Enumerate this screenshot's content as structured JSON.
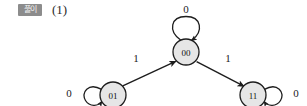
{
  "header": {
    "badge_label": "풀이",
    "item_number": "(1)"
  },
  "diagram": {
    "colors": {
      "node_fill": "#e6e6e6",
      "node_stroke": "#1d1d1d",
      "edge_stroke": "#1d1d1d",
      "text": "#111111",
      "badge_bg": "#8c8c8c",
      "badge_text": "#f2f2f2",
      "background": "#ffffff"
    },
    "nodes": [
      {
        "id": "n00",
        "label": "00",
        "cx": 186,
        "cy": 52,
        "r": 13
      },
      {
        "id": "n01",
        "label": "01",
        "cx": 113,
        "cy": 95,
        "r": 13
      },
      {
        "id": "n11",
        "label": "11",
        "cx": 253,
        "cy": 95,
        "r": 13
      }
    ],
    "self_loops": [
      {
        "id": "loop00",
        "node": "n00",
        "label": "0",
        "position": "top",
        "label_x": 186,
        "label_y": 9
      },
      {
        "id": "loop01",
        "node": "n01",
        "label": "0",
        "position": "left",
        "label_x": 69,
        "label_y": 93
      },
      {
        "id": "loop11",
        "node": "n11",
        "label": "0",
        "position": "right",
        "label_x": 296,
        "label_y": 93
      }
    ],
    "edges": [
      {
        "id": "e01-00",
        "from": "n01",
        "to": "n00",
        "label": "1",
        "label_x": 136,
        "label_y": 58
      },
      {
        "id": "e00-11",
        "from": "n00",
        "to": "n11",
        "label": "1",
        "label_x": 228,
        "label_y": 58
      }
    ]
  }
}
